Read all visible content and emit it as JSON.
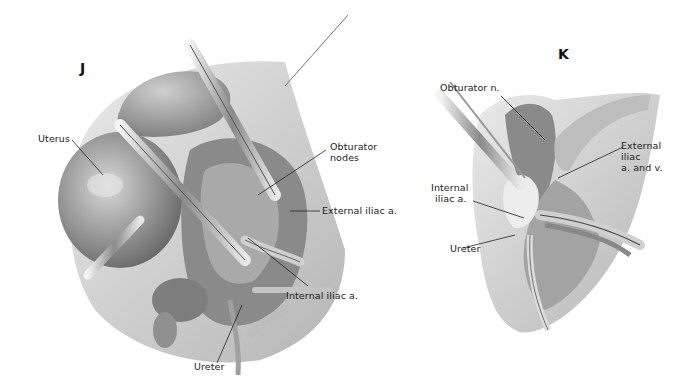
{
  "figure": {
    "panels": [
      {
        "id": "J",
        "letter": "J",
        "labels": {
          "uterus": "Uterus",
          "obturator_nodes_1": "Obturator",
          "obturator_nodes_2": "nodes",
          "external_iliac": "External iliac a.",
          "internal_iliac": "Internal iliac a.",
          "ureter": "Ureter"
        }
      },
      {
        "id": "K",
        "letter": "K",
        "labels": {
          "obturator_n": "Obturator n.",
          "external_iliac_1": "External",
          "external_iliac_2": "iliac",
          "external_iliac_3": "a. and v.",
          "internal_iliac_1": "Internal",
          "internal_iliac_2": "iliac a.",
          "ureter": "Ureter"
        }
      }
    ],
    "colors": {
      "background": "#ffffff",
      "tissue_dark": "#6e6e6e",
      "tissue_mid": "#9a9a9a",
      "tissue_light": "#c9c9c9",
      "leader_line": "#222222"
    }
  }
}
